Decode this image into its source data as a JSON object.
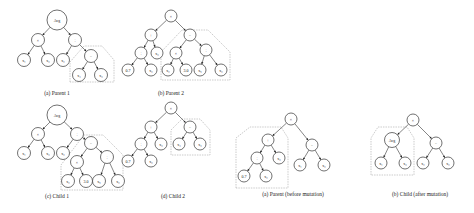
{
  "figure": {
    "panels": [
      {
        "id": "parent1",
        "caption": "(a) Parent 1",
        "caption_pos": [
          57,
          95
        ],
        "nodes": [
          {
            "id": "n0",
            "label": "Avg",
            "x": 57,
            "y": 20,
            "r": 10
          },
          {
            "id": "n1",
            "label": "×",
            "x": 38,
            "y": 40,
            "r": 6.5
          },
          {
            "id": "n2",
            "label": "÷",
            "x": 75,
            "y": 40,
            "r": 6.5
          },
          {
            "id": "n3",
            "label": "x₁",
            "x": 24,
            "y": 60,
            "r": 6.5
          },
          {
            "id": "n4",
            "label": "x₃",
            "x": 48,
            "y": 60,
            "r": 6.5
          },
          {
            "id": "n5",
            "label": "x₂",
            "x": 63,
            "y": 60,
            "r": 6.5
          },
          {
            "id": "n6",
            "label": "−",
            "x": 91,
            "y": 56,
            "r": 6.5
          },
          {
            "id": "n7",
            "label": "x₄",
            "x": 79,
            "y": 75,
            "r": 6.5
          },
          {
            "id": "n8",
            "label": "x₃",
            "x": 101,
            "y": 75,
            "r": 6.5
          }
        ],
        "edges": [
          [
            "n0",
            "n1"
          ],
          [
            "n0",
            "n2"
          ],
          [
            "n1",
            "n3"
          ],
          [
            "n1",
            "n4"
          ],
          [
            "n2",
            "n5"
          ],
          [
            "n2",
            "n6"
          ],
          [
            "n6",
            "n7"
          ],
          [
            "n6",
            "n8"
          ]
        ],
        "region": [
          [
            70,
            82
          ],
          [
            70,
            62
          ],
          [
            84,
            46
          ],
          [
            102,
            46
          ],
          [
            114,
            60
          ],
          [
            114,
            82
          ]
        ]
      },
      {
        "id": "parent2",
        "caption": "(b) Parent 2",
        "caption_pos": [
          171,
          95
        ],
        "nodes": [
          {
            "id": "m0",
            "label": "×",
            "x": 171,
            "y": 16,
            "r": 6
          },
          {
            "id": "m1",
            "label": "+",
            "x": 151,
            "y": 35,
            "r": 6
          },
          {
            "id": "m2",
            "label": "−",
            "x": 190,
            "y": 35,
            "r": 6
          },
          {
            "id": "m3",
            "label": "÷",
            "x": 141,
            "y": 53,
            "r": 6
          },
          {
            "id": "m4",
            "label": "x₃",
            "x": 157,
            "y": 53,
            "r": 6
          },
          {
            "id": "m5",
            "label": "×",
            "x": 176,
            "y": 53,
            "r": 6
          },
          {
            "id": "m6",
            "label": "÷",
            "x": 206,
            "y": 50,
            "r": 6
          },
          {
            "id": "m7",
            "label": "0.7",
            "x": 128,
            "y": 70,
            "r": 6
          },
          {
            "id": "m8",
            "label": "x₂",
            "x": 151,
            "y": 70,
            "r": 6
          },
          {
            "id": "m9",
            "label": "x₂",
            "x": 168,
            "y": 70,
            "r": 6
          },
          {
            "id": "m10",
            "label": "3.0",
            "x": 186,
            "y": 70,
            "r": 6
          },
          {
            "id": "m11",
            "label": "x₅",
            "x": 200,
            "y": 70,
            "r": 6
          },
          {
            "id": "m12",
            "label": "x₂",
            "x": 221,
            "y": 70,
            "r": 6
          }
        ],
        "edges": [
          [
            "m0",
            "m1"
          ],
          [
            "m0",
            "m2"
          ],
          [
            "m1",
            "m3"
          ],
          [
            "m1",
            "m4"
          ],
          [
            "m3",
            "m7"
          ],
          [
            "m3",
            "m8"
          ],
          [
            "m2",
            "m5"
          ],
          [
            "m2",
            "m6"
          ],
          [
            "m5",
            "m9"
          ],
          [
            "m5",
            "m10"
          ],
          [
            "m6",
            "m11"
          ],
          [
            "m6",
            "m12"
          ]
        ],
        "region": [
          [
            161,
            80
          ],
          [
            161,
            52
          ],
          [
            182,
            30
          ],
          [
            208,
            30
          ],
          [
            230,
            52
          ],
          [
            230,
            80
          ]
        ]
      },
      {
        "id": "child1",
        "caption": "(c) Child 1",
        "caption_pos": [
          57,
          198
        ],
        "nodes": [
          {
            "id": "c0",
            "label": "Avg",
            "x": 57,
            "y": 115,
            "r": 10
          },
          {
            "id": "c1",
            "label": "×",
            "x": 38,
            "y": 134,
            "r": 6.5
          },
          {
            "id": "c2",
            "label": "÷",
            "x": 77,
            "y": 134,
            "r": 6.5
          },
          {
            "id": "c3",
            "label": "x₁",
            "x": 24,
            "y": 153,
            "r": 6.5
          },
          {
            "id": "c4",
            "label": "x₃",
            "x": 48,
            "y": 153,
            "r": 6.5
          },
          {
            "id": "c5",
            "label": "x₂",
            "x": 63,
            "y": 153,
            "r": 6.5
          },
          {
            "id": "c6",
            "label": "−",
            "x": 91,
            "y": 143,
            "r": 6.5
          },
          {
            "id": "c7",
            "label": "×",
            "x": 77,
            "y": 162,
            "r": 6.5
          },
          {
            "id": "c8",
            "label": "÷",
            "x": 107,
            "y": 157,
            "r": 6.5
          },
          {
            "id": "c9",
            "label": "x₂",
            "x": 68,
            "y": 181,
            "r": 6.5
          },
          {
            "id": "c10",
            "label": "3.0",
            "x": 86,
            "y": 181,
            "r": 6.5
          },
          {
            "id": "c11",
            "label": "x₅",
            "x": 99,
            "y": 181,
            "r": 6.5
          },
          {
            "id": "c12",
            "label": "x₂",
            "x": 118,
            "y": 181,
            "r": 6.5
          }
        ],
        "edges": [
          [
            "c0",
            "c1"
          ],
          [
            "c0",
            "c2"
          ],
          [
            "c1",
            "c3"
          ],
          [
            "c1",
            "c4"
          ],
          [
            "c2",
            "c5"
          ],
          [
            "c2",
            "c6"
          ],
          [
            "c6",
            "c7"
          ],
          [
            "c6",
            "c8"
          ],
          [
            "c7",
            "c9"
          ],
          [
            "c7",
            "c10"
          ],
          [
            "c8",
            "c11"
          ],
          [
            "c8",
            "c12"
          ]
        ],
        "region": [
          [
            61,
            190
          ],
          [
            61,
            165
          ],
          [
            84,
            135
          ],
          [
            103,
            135
          ],
          [
            123,
            155
          ],
          [
            123,
            190
          ]
        ]
      },
      {
        "id": "child2",
        "caption": "(d) Child 2",
        "caption_pos": [
          173,
          198
        ],
        "nodes": [
          {
            "id": "d0",
            "label": "×",
            "x": 171,
            "y": 108,
            "r": 6
          },
          {
            "id": "d1",
            "label": "+",
            "x": 151,
            "y": 127,
            "r": 6
          },
          {
            "id": "d2",
            "label": "−",
            "x": 190,
            "y": 127,
            "r": 6
          },
          {
            "id": "d3",
            "label": "÷",
            "x": 141,
            "y": 144,
            "r": 6
          },
          {
            "id": "d4",
            "label": "x₃",
            "x": 161,
            "y": 144,
            "r": 6
          },
          {
            "id": "d5",
            "label": "x₄",
            "x": 179,
            "y": 144,
            "r": 6
          },
          {
            "id": "d6",
            "label": "x₃",
            "x": 200,
            "y": 144,
            "r": 6
          },
          {
            "id": "d7",
            "label": "0.7",
            "x": 128,
            "y": 161,
            "r": 6
          },
          {
            "id": "d8",
            "label": "x₂",
            "x": 151,
            "y": 161,
            "r": 6
          }
        ],
        "edges": [
          [
            "d0",
            "d1"
          ],
          [
            "d0",
            "d2"
          ],
          [
            "d1",
            "d3"
          ],
          [
            "d1",
            "d4"
          ],
          [
            "d3",
            "d7"
          ],
          [
            "d3",
            "d8"
          ],
          [
            "d2",
            "d5"
          ],
          [
            "d2",
            "d6"
          ]
        ],
        "region": [
          [
            171,
            155
          ],
          [
            171,
            130
          ],
          [
            182,
            119
          ],
          [
            200,
            119
          ],
          [
            210,
            130
          ],
          [
            210,
            155
          ]
        ]
      },
      {
        "id": "parent_before_mutation",
        "caption": "(a) Parent (before mutation)",
        "caption_pos": [
          293,
          196
        ],
        "nodes": [
          {
            "id": "p0",
            "label": "×",
            "x": 291,
            "y": 119,
            "r": 6
          },
          {
            "id": "p1",
            "label": "+",
            "x": 268,
            "y": 140,
            "r": 6
          },
          {
            "id": "p2",
            "label": "−",
            "x": 312,
            "y": 145,
            "r": 6
          },
          {
            "id": "p3",
            "label": "÷",
            "x": 257,
            "y": 158,
            "r": 6
          },
          {
            "id": "p4",
            "label": "x₃",
            "x": 279,
            "y": 158,
            "r": 6
          },
          {
            "id": "p5",
            "label": "x₁",
            "x": 300,
            "y": 165,
            "r": 6
          },
          {
            "id": "p6",
            "label": "x₂",
            "x": 324,
            "y": 165,
            "r": 6
          },
          {
            "id": "p7",
            "label": "0.7",
            "x": 244,
            "y": 176,
            "r": 6
          },
          {
            "id": "p8",
            "label": "x₂",
            "x": 266,
            "y": 176,
            "r": 6
          }
        ],
        "edges": [
          [
            "p0",
            "p1"
          ],
          [
            "p0",
            "p2"
          ],
          [
            "p1",
            "p3"
          ],
          [
            "p1",
            "p4"
          ],
          [
            "p3",
            "p7"
          ],
          [
            "p3",
            "p8"
          ],
          [
            "p2",
            "p5"
          ],
          [
            "p2",
            "p6"
          ]
        ],
        "region": [
          [
            236,
            188
          ],
          [
            236,
            138
          ],
          [
            250,
            127
          ],
          [
            281,
            127
          ],
          [
            288,
            138
          ],
          [
            288,
            188
          ]
        ]
      },
      {
        "id": "child_after_mutation",
        "caption": "(b) Child (after mutation)",
        "caption_pos": [
          420,
          196
        ],
        "nodes": [
          {
            "id": "q0",
            "label": "×",
            "x": 413,
            "y": 120,
            "r": 6
          },
          {
            "id": "q1",
            "label": "Avg",
            "x": 392,
            "y": 140,
            "r": 7.5
          },
          {
            "id": "q2",
            "label": "−",
            "x": 436,
            "y": 143,
            "r": 6
          },
          {
            "id": "q3",
            "label": "x₁",
            "x": 381,
            "y": 163,
            "r": 6
          },
          {
            "id": "q4",
            "label": "x₃",
            "x": 405,
            "y": 163,
            "r": 6
          },
          {
            "id": "q5",
            "label": "x₂",
            "x": 423,
            "y": 163,
            "r": 6
          },
          {
            "id": "q6",
            "label": "x₂",
            "x": 448,
            "y": 163,
            "r": 6
          }
        ],
        "edges": [
          [
            "q0",
            "q1"
          ],
          [
            "q0",
            "q2"
          ],
          [
            "q1",
            "q3"
          ],
          [
            "q1",
            "q4"
          ],
          [
            "q2",
            "q5"
          ],
          [
            "q2",
            "q6"
          ]
        ],
        "region": [
          [
            371,
            175
          ],
          [
            371,
            138
          ],
          [
            378,
            127
          ],
          [
            407,
            127
          ],
          [
            414,
            138
          ],
          [
            414,
            175
          ]
        ]
      }
    ]
  }
}
